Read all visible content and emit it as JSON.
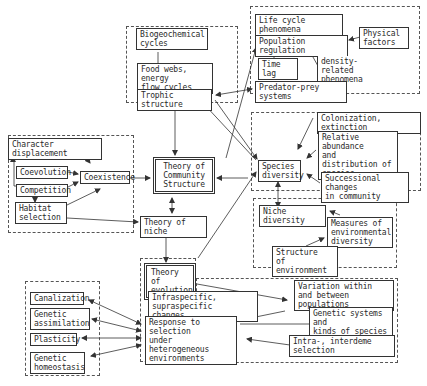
{
  "diagram": {
    "type": "concept-map",
    "title": "",
    "groups": [
      {
        "id": "g-trophic"
      },
      {
        "id": "g-population"
      },
      {
        "id": "g-coexistence"
      },
      {
        "id": "g-species-diversity"
      },
      {
        "id": "g-niche-diversity"
      },
      {
        "id": "g-evolution"
      },
      {
        "id": "g-response"
      }
    ],
    "nodes": {
      "biogeochemical": "Biogeochemical\n cycles",
      "foodwebs": "Food webs, energy\n flow cycles",
      "trophic": "Trophic structure",
      "lifecycle": "Life cycle phenomena",
      "popreg": "Population regulation",
      "physical": "Physical\n   factors",
      "timelag": "Time lag",
      "density": "density-related\n phenomena",
      "predator": "Predator-prey systems",
      "chardisp": "Character displacement",
      "coevolution": "Coevolution",
      "competition": "Competition",
      "habitat": "Habitat\n selection",
      "coexistence": "Coexistence",
      "community": "Theory of\nCommunity\nStructure",
      "niche": "Theory of niche",
      "colonization": "Colonization, extinction",
      "relabund": "Relative abundance\nand distribution of\nspecies",
      "specdiv": "Species\ndiversity",
      "successional": "Successional changes\nin community",
      "nichediv": "Niche diversity",
      "measures": "Measures of\n environmental\n diversity",
      "structure": "Structure\nof environment",
      "evolution": "Theory of\nevolution",
      "infra": "Infraspecific, supraspecific\n changes",
      "variation": "Variation within\nand between populations",
      "response": "Response to selection\nunder heterogeneous\nenvironments",
      "genetic_systems": "Genetic systems and\n kinds of species",
      "intra": "Intra-, interdeme selection",
      "canalization": "Canalization",
      "assimilation": "Genetic\n assimilation",
      "plasticity": "Plasticity",
      "homeostasis": "Genetic\n homeostasis"
    },
    "edges": [
      {
        "from": "biogeochemical",
        "to": "foodwebs",
        "arrow": "none"
      },
      {
        "from": "foodwebs",
        "to": "trophic",
        "arrow": "end"
      },
      {
        "from": "trophic",
        "to": "community",
        "arrow": "end"
      },
      {
        "from": "trophic",
        "to": "predator",
        "arrow": "both"
      },
      {
        "from": "lifecycle",
        "to": "popreg",
        "arrow": "end"
      },
      {
        "from": "physical",
        "to": "popreg",
        "arrow": "end"
      },
      {
        "from": "popreg",
        "to": "timelag",
        "arrow": "none"
      },
      {
        "from": "density",
        "to": "popreg",
        "arrow": "end"
      },
      {
        "from": "specdiv",
        "to": "trophic",
        "arrow": "end"
      },
      {
        "from": "niche",
        "to": "popreg",
        "arrow": "end"
      },
      {
        "from": "coevolution",
        "to": "chardisp",
        "arrow": "end"
      },
      {
        "from": "competition",
        "to": "chardisp",
        "arrow": "end"
      },
      {
        "from": "chardisp",
        "to": "coexistence",
        "arrow": "end"
      },
      {
        "from": "coevolution",
        "to": "coexistence",
        "arrow": "end"
      },
      {
        "from": "competition",
        "to": "coexistence",
        "arrow": "end"
      },
      {
        "from": "competition",
        "to": "habitat",
        "arrow": "end"
      },
      {
        "from": "habitat",
        "to": "coexistence",
        "arrow": "end"
      },
      {
        "from": "habitat",
        "to": "niche",
        "arrow": "end"
      },
      {
        "from": "coexistence",
        "to": "community",
        "arrow": "end"
      },
      {
        "from": "community",
        "to": "niche",
        "arrow": "both"
      },
      {
        "from": "niche",
        "to": "evolution",
        "arrow": "both"
      },
      {
        "from": "trophic",
        "to": "specdiv",
        "arrow": "end"
      },
      {
        "from": "specdiv",
        "to": "community",
        "arrow": "end"
      },
      {
        "from": "colonization",
        "to": "specdiv",
        "arrow": "end"
      },
      {
        "from": "relabund",
        "to": "specdiv",
        "arrow": "end"
      },
      {
        "from": "successional",
        "to": "specdiv",
        "arrow": "end"
      },
      {
        "from": "specdiv",
        "to": "nichediv",
        "arrow": "both"
      },
      {
        "from": "measures",
        "to": "nichediv",
        "arrow": "end"
      },
      {
        "from": "structure",
        "to": "measures",
        "arrow": "end"
      },
      {
        "from": "evolution",
        "to": "specdiv",
        "arrow": "end"
      },
      {
        "from": "infra",
        "to": "evolution",
        "arrow": "end"
      },
      {
        "from": "response",
        "to": "infra",
        "arrow": "end"
      },
      {
        "from": "evolution",
        "to": "variation",
        "arrow": "end"
      },
      {
        "from": "variation",
        "to": "response",
        "arrow": "end"
      },
      {
        "from": "genetic_systems",
        "to": "response",
        "arrow": "none"
      },
      {
        "from": "intra",
        "to": "response",
        "arrow": "end"
      },
      {
        "from": "response",
        "to": "canalization",
        "arrow": "both"
      },
      {
        "from": "response",
        "to": "assimilation",
        "arrow": "both"
      },
      {
        "from": "response",
        "to": "plasticity",
        "arrow": "both"
      },
      {
        "from": "response",
        "to": "homeostasis",
        "arrow": "both"
      }
    ]
  }
}
